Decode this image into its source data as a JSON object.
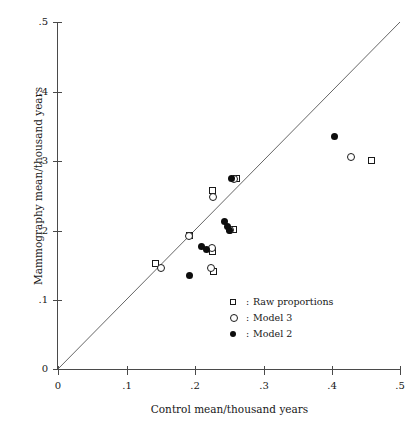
{
  "chart_data": {
    "type": "scatter",
    "title": "",
    "xlabel": "Control mean/thousand years",
    "ylabel": "Mammography mean/thousand years",
    "xlim": [
      0,
      0.5
    ],
    "ylim": [
      0,
      0.5
    ],
    "xticks": [
      "0",
      ".1",
      ".2",
      ".3",
      ".4",
      ".5"
    ],
    "xtick_values": [
      0,
      0.1,
      0.2,
      0.3,
      0.4,
      0.5
    ],
    "yticks": [
      "0",
      ".1",
      ".2",
      ".3",
      ".4",
      ".5"
    ],
    "ytick_values": [
      0,
      0.1,
      0.2,
      0.3,
      0.4,
      0.5
    ],
    "grid": false,
    "reference_line": {
      "label": "y = x identity line",
      "from": [
        0,
        0
      ],
      "to": [
        0.5,
        0.5
      ]
    },
    "legend_position": "lower right",
    "series": [
      {
        "name": "Raw proportions",
        "marker": "open-square",
        "points": [
          [
            0.143,
            0.152
          ],
          [
            0.192,
            0.193
          ],
          [
            0.226,
            0.257
          ],
          [
            0.226,
            0.169
          ],
          [
            0.228,
            0.14
          ],
          [
            0.256,
            0.201
          ],
          [
            0.261,
            0.274
          ],
          [
            0.458,
            0.3
          ]
        ]
      },
      {
        "name": "Model 3",
        "marker": "open-circle",
        "points": [
          [
            0.15,
            0.146
          ],
          [
            0.192,
            0.192
          ],
          [
            0.226,
            0.248
          ],
          [
            0.225,
            0.174
          ],
          [
            0.224,
            0.146
          ],
          [
            0.252,
            0.2
          ],
          [
            0.257,
            0.274
          ],
          [
            0.428,
            0.306
          ]
        ]
      },
      {
        "name": "Model 2",
        "marker": "filled-circle",
        "points": [
          [
            0.192,
            0.135
          ],
          [
            0.21,
            0.177
          ],
          [
            0.217,
            0.172
          ],
          [
            0.244,
            0.213
          ],
          [
            0.248,
            0.205
          ],
          [
            0.25,
            0.199
          ],
          [
            0.254,
            0.274
          ],
          [
            0.404,
            0.335
          ]
        ]
      }
    ]
  },
  "axes": {
    "x": {
      "title": "Control mean/thousand years",
      "labels": [
        "0",
        ".1",
        ".2",
        ".3",
        ".4",
        ".5"
      ]
    },
    "y": {
      "title": "Mammography mean/thousand years",
      "labels": [
        "0",
        ".1",
        ".2",
        ".3",
        ".4",
        ".5"
      ]
    }
  },
  "legend": {
    "items": [
      {
        "glyph": "open-square-icon",
        "colon": ":",
        "label": "Raw proportions"
      },
      {
        "glyph": "open-circle-icon",
        "colon": ":",
        "label": "Model 3"
      },
      {
        "glyph": "filled-circle-icon",
        "colon": ":",
        "label": "Model 2"
      }
    ]
  },
  "colors": {
    "ink": "#1a1a1a",
    "axis": "#4a4a4a",
    "background": "#ffffff",
    "marker_fill": "#0d0d0d"
  }
}
